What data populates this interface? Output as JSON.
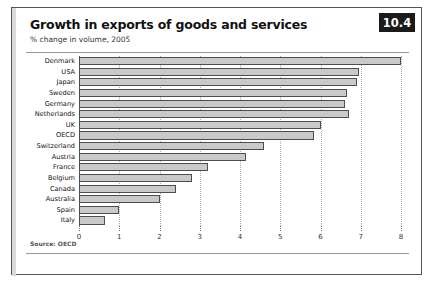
{
  "figure": {
    "number": "10.4",
    "title": "Growth in exports of goods and services",
    "subtitle": "% change in volume, 2005",
    "source": "Source: OECD"
  },
  "chart_data": {
    "type": "bar",
    "orientation": "horizontal",
    "title": "Growth in exports of goods and services",
    "subtitle": "% change in volume, 2005",
    "xlabel": "",
    "ylabel": "",
    "xlim": [
      0,
      8
    ],
    "xticks": [
      "0",
      "1",
      "2",
      "3",
      "4",
      "5",
      "6",
      "7",
      "8"
    ],
    "grid": "vertical-dotted",
    "legend": "none",
    "bar_color": "#c9c9c9",
    "bar_border_color": "#4d4d4d",
    "categories": [
      "Denmark",
      "USA",
      "Japan",
      "Sweden",
      "Germany",
      "Netherlands",
      "UK",
      "OECD",
      "Switzerland",
      "Austria",
      "France",
      "Belgium",
      "Canada",
      "Australia",
      "Spain",
      "Italy"
    ],
    "values": [
      8.0,
      6.95,
      6.9,
      6.65,
      6.6,
      6.7,
      6.0,
      5.85,
      4.6,
      4.15,
      3.2,
      2.8,
      2.4,
      2.0,
      1.0,
      0.65
    ],
    "series": [
      {
        "name": "% change in volume, 2005",
        "values": [
          8.0,
          6.95,
          6.9,
          6.65,
          6.6,
          6.7,
          6.0,
          5.85,
          4.6,
          4.15,
          3.2,
          2.8,
          2.4,
          2.0,
          1.0,
          0.65
        ]
      }
    ],
    "source": "Source: OECD"
  }
}
